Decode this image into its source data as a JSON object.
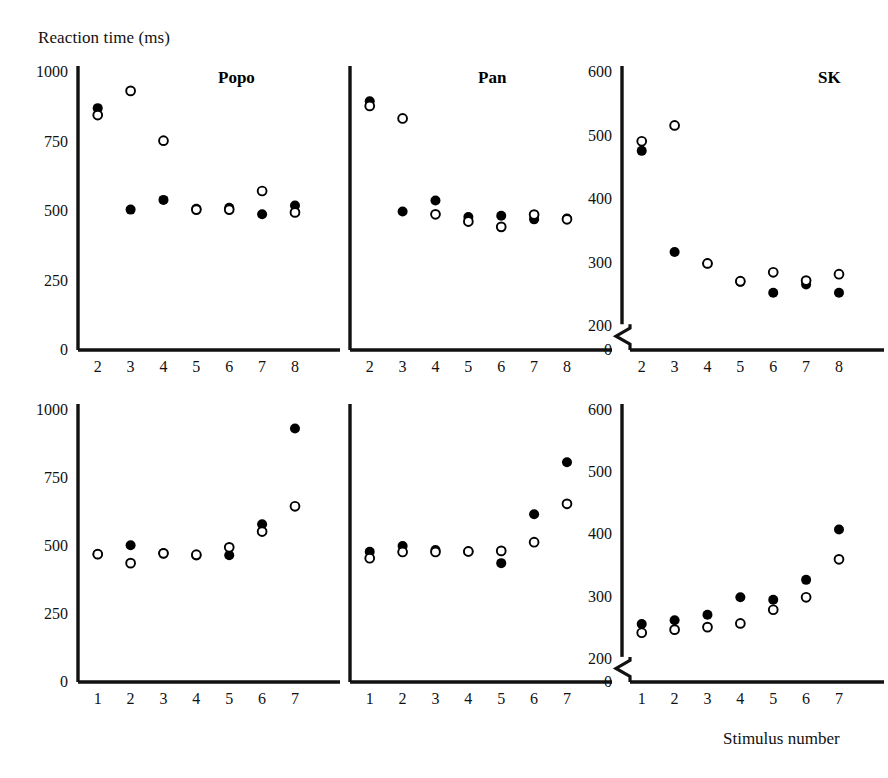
{
  "figure": {
    "y_axis_label": "Reaction time (ms)",
    "x_axis_label": "Stimulus number",
    "ink_color": "#111111",
    "marker_filled_color": "#000000",
    "marker_open_color": "#ffffff",
    "marker_open_stroke": "#000000"
  },
  "chart_data": [
    {
      "id": "popo-top",
      "type": "scatter",
      "title": "Popo",
      "xlabel": "",
      "ylabel": "Reaction time (ms)",
      "x": [
        2,
        3,
        4,
        5,
        6,
        7,
        8
      ],
      "xticklabels": [
        "2",
        "3",
        "4",
        "5",
        "6",
        "7",
        "8"
      ],
      "xlim": [
        1.4,
        8.7
      ],
      "ylim": [
        0,
        1000
      ],
      "yticks": [
        0,
        250,
        500,
        750,
        1000
      ],
      "yticklabels": [
        "0",
        "250",
        "500",
        "750",
        "1000"
      ],
      "axis_break": false,
      "grid": false,
      "legend": "none",
      "series": [
        {
          "name": "filled",
          "marker": "filled-circle",
          "values": [
            870,
            505,
            540,
            508,
            512,
            488,
            520
          ]
        },
        {
          "name": "open",
          "marker": "open-circle",
          "values": [
            845,
            932,
            753,
            505,
            505,
            572,
            495
          ]
        }
      ]
    },
    {
      "id": "pan-top",
      "type": "scatter",
      "title": "Pan",
      "xlabel": "",
      "ylabel": "",
      "x": [
        2,
        3,
        4,
        5,
        6,
        7,
        8
      ],
      "xticklabels": [
        "2",
        "3",
        "4",
        "5",
        "6",
        "7",
        "8"
      ],
      "xlim": [
        1.4,
        8.7
      ],
      "ylim": [
        0,
        1000
      ],
      "yticks": [
        0,
        250,
        500,
        750,
        1000
      ],
      "yticklabels": [],
      "axis_break": false,
      "grid": false,
      "legend": "none",
      "series": [
        {
          "name": "filled",
          "marker": "filled-circle",
          "values": [
            895,
            498,
            538,
            478,
            483,
            470,
            473
          ]
        },
        {
          "name": "open",
          "marker": "open-circle",
          "values": [
            878,
            833,
            488,
            462,
            443,
            487,
            470
          ]
        }
      ]
    },
    {
      "id": "sk-top",
      "type": "scatter",
      "title": "SK",
      "xlabel": "",
      "ylabel": "",
      "x": [
        2,
        3,
        4,
        5,
        6,
        7,
        8
      ],
      "xticklabels": [
        "2",
        "3",
        "4",
        "5",
        "6",
        "7",
        "8"
      ],
      "xlim": [
        1.4,
        8.7
      ],
      "ylim": [
        0,
        600
      ],
      "yticks": [
        0,
        200,
        300,
        400,
        500,
        600
      ],
      "yticklabels": [
        "0",
        "200",
        "300",
        "400",
        "500",
        "600"
      ],
      "axis_break": true,
      "axis_break_between": [
        0,
        200
      ],
      "grid": false,
      "legend": "none",
      "series": [
        {
          "name": "filled",
          "marker": "filled-circle",
          "values": [
            476,
            317,
            299,
            270,
            253,
            266,
            253
          ]
        },
        {
          "name": "open",
          "marker": "open-circle",
          "values": [
            491,
            516,
            299,
            271,
            285,
            272,
            282
          ]
        }
      ]
    },
    {
      "id": "popo-bottom",
      "type": "scatter",
      "title": "",
      "xlabel": "",
      "ylabel": "Reaction time (ms)",
      "x": [
        1,
        2,
        3,
        4,
        5,
        6,
        7
      ],
      "xticklabels": [
        "1",
        "2",
        "3",
        "4",
        "5",
        "6",
        "7"
      ],
      "xlim": [
        0.4,
        7.7
      ],
      "ylim": [
        0,
        1000
      ],
      "yticks": [
        0,
        250,
        500,
        750,
        1000
      ],
      "yticklabels": [
        "0",
        "250",
        "500",
        "750",
        "1000"
      ],
      "axis_break": false,
      "grid": false,
      "legend": "none",
      "series": [
        {
          "name": "filled",
          "marker": "filled-circle",
          "values": [
            470,
            503,
            473,
            465,
            466,
            580,
            932
          ]
        },
        {
          "name": "open",
          "marker": "open-circle",
          "values": [
            470,
            437,
            473,
            468,
            495,
            553,
            646
          ]
        }
      ]
    },
    {
      "id": "pan-bottom",
      "type": "scatter",
      "title": "",
      "xlabel": "",
      "ylabel": "",
      "x": [
        1,
        2,
        3,
        4,
        5,
        6,
        7
      ],
      "xticklabels": [
        "1",
        "2",
        "3",
        "4",
        "5",
        "6",
        "7"
      ],
      "xlim": [
        0.4,
        7.7
      ],
      "ylim": [
        0,
        1000
      ],
      "yticks": [
        0,
        250,
        500,
        750,
        1000
      ],
      "yticklabels": [],
      "axis_break": false,
      "grid": false,
      "legend": "none",
      "series": [
        {
          "name": "filled",
          "marker": "filled-circle",
          "values": [
            479,
            500,
            485,
            480,
            437,
            617,
            808
          ]
        },
        {
          "name": "open",
          "marker": "open-circle",
          "values": [
            455,
            478,
            478,
            480,
            482,
            514,
            655
          ]
        }
      ]
    },
    {
      "id": "sk-bottom",
      "type": "scatter",
      "title": "",
      "xlabel": "Stimulus number",
      "ylabel": "",
      "x": [
        1,
        2,
        3,
        4,
        5,
        6,
        7
      ],
      "xticklabels": [
        "1",
        "2",
        "3",
        "4",
        "5",
        "6",
        "7"
      ],
      "xlim": [
        0.4,
        7.7
      ],
      "ylim": [
        0,
        600
      ],
      "yticks": [
        0,
        200,
        300,
        400,
        500,
        600
      ],
      "yticklabels": [
        "0",
        "200",
        "300",
        "400",
        "500",
        "600"
      ],
      "axis_break": true,
      "axis_break_between": [
        0,
        200
      ],
      "grid": false,
      "legend": "none",
      "series": [
        {
          "name": "filled",
          "marker": "filled-circle",
          "values": [
            256,
            262,
            271,
            299,
            295,
            327,
            408
          ]
        },
        {
          "name": "open",
          "marker": "open-circle",
          "values": [
            242,
            247,
            251,
            257,
            279,
            299,
            360
          ]
        }
      ]
    }
  ],
  "panel_layout": [
    {
      "id": "popo-top",
      "left": 78,
      "top": 72,
      "plot_w": 240,
      "plot_h": 278,
      "title_x": 218,
      "title_y": 68
    },
    {
      "id": "pan-top",
      "left": 350,
      "top": 72,
      "plot_w": 240,
      "plot_h": 278,
      "title_x": 478,
      "title_y": 68
    },
    {
      "id": "sk-top",
      "left": 622,
      "top": 72,
      "plot_w": 240,
      "plot_h": 278,
      "title_x": 818,
      "title_y": 68
    },
    {
      "id": "popo-bottom",
      "left": 78,
      "top": 410,
      "plot_w": 240,
      "plot_h": 272,
      "title_x": 218,
      "title_y": 406
    },
    {
      "id": "pan-bottom",
      "left": 350,
      "top": 410,
      "plot_w": 240,
      "plot_h": 272,
      "title_x": 478,
      "title_y": 406
    },
    {
      "id": "sk-bottom",
      "left": 622,
      "top": 410,
      "plot_w": 240,
      "plot_h": 272,
      "title_x": 818,
      "title_y": 406
    }
  ]
}
